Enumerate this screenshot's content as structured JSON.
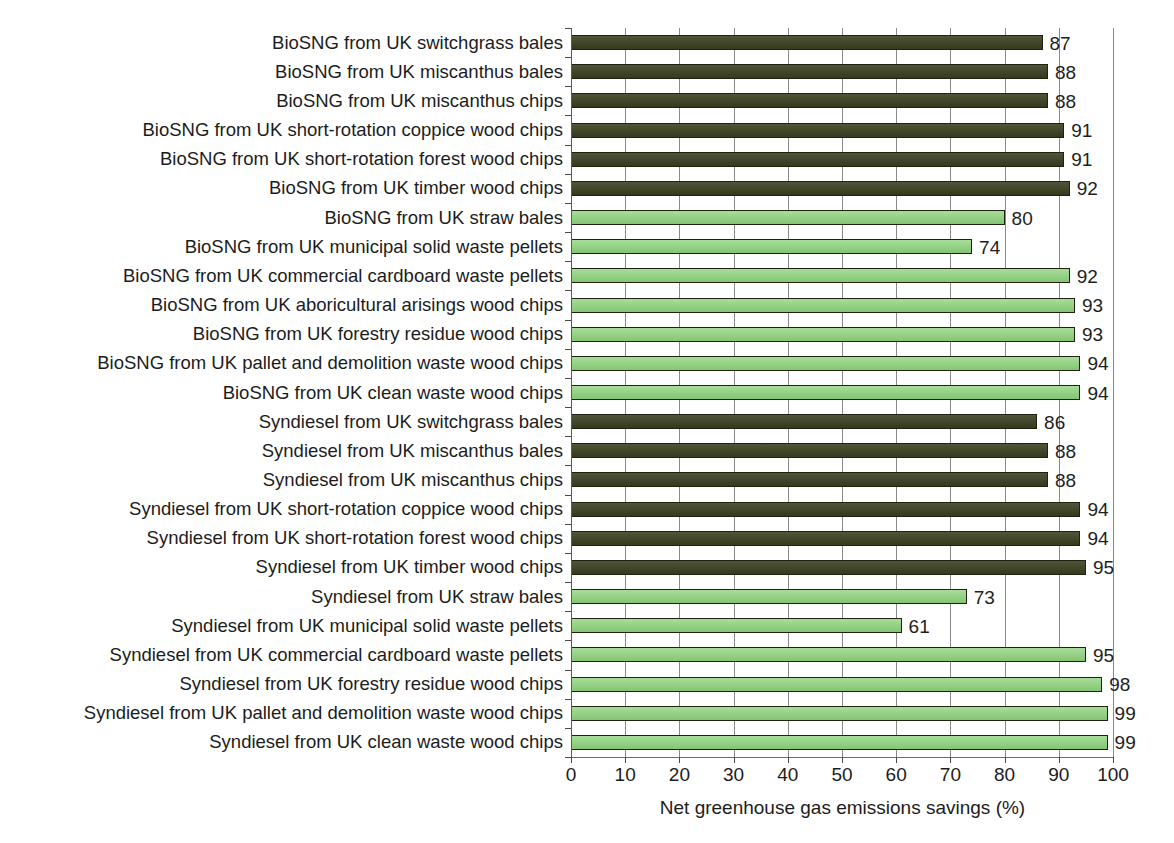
{
  "chart_data": {
    "type": "bar",
    "orientation": "horizontal",
    "title": "",
    "xlabel": "Net greenhouse gas emissions savings (%)",
    "ylabel": "",
    "xlim": [
      0,
      100
    ],
    "xticks": [
      0,
      10,
      20,
      30,
      40,
      50,
      60,
      70,
      80,
      90,
      100
    ],
    "xtick_labels": [
      "0",
      "10",
      "20",
      "30",
      "40",
      "50",
      "60",
      "70",
      "80",
      "90",
      "100"
    ],
    "grid": "vertical",
    "legend": "none",
    "categories": [
      "BioSNG from UK switchgrass bales",
      "BioSNG from UK miscanthus bales",
      "BioSNG from UK miscanthus chips",
      "BioSNG from UK short-rotation coppice wood chips",
      "BioSNG from UK short-rotation forest wood chips",
      "BioSNG from UK timber wood chips",
      "BioSNG from UK straw bales",
      "BioSNG from UK municipal solid waste pellets",
      "BioSNG from UK commercial cardboard waste pellets",
      "BioSNG from UK aboricultural arisings wood chips",
      "BioSNG from UK forestry residue wood chips",
      "BioSNG from UK pallet and demolition waste wood chips",
      "BioSNG from UK clean waste wood chips",
      "Syndiesel from UK switchgrass bales",
      "Syndiesel from UK miscanthus bales",
      "Syndiesel from UK miscanthus chips",
      "Syndiesel from UK short-rotation coppice wood chips",
      "Syndiesel from UK short-rotation forest wood chips",
      "Syndiesel from UK timber wood chips",
      "Syndiesel from UK straw bales",
      "Syndiesel from UK municipal solid waste pellets",
      "Syndiesel from UK commercial cardboard waste pellets",
      "Syndiesel from UK forestry residue wood chips",
      "Syndiesel from UK pallet and demolition waste wood chips",
      "Syndiesel from UK clean waste wood chips"
    ],
    "values": [
      87,
      88,
      88,
      91,
      91,
      92,
      80,
      74,
      92,
      93,
      93,
      94,
      94,
      86,
      88,
      88,
      94,
      94,
      95,
      73,
      61,
      95,
      98,
      99,
      99
    ],
    "value_labels": [
      "87",
      "88",
      "88",
      "91",
      "91",
      "92",
      "80",
      "74",
      "92",
      "93",
      "93",
      "94",
      "94",
      "86",
      "88",
      "88",
      "94",
      "94",
      "95",
      "73",
      "61",
      "95",
      "98",
      "99",
      "99"
    ],
    "group_of_bar": [
      "dark",
      "dark",
      "dark",
      "dark",
      "dark",
      "dark",
      "light",
      "light",
      "light",
      "light",
      "light",
      "light",
      "light",
      "dark",
      "dark",
      "dark",
      "dark",
      "dark",
      "dark",
      "light",
      "light",
      "light",
      "light",
      "light",
      "light"
    ],
    "colors": {
      "dark": "#3c4122",
      "light": "#8ed47c",
      "bar_outline": "#20220f",
      "gridline": "#8a8a8a",
      "axis": "#5a5a5a",
      "text": "#1c1c1c",
      "background": "#ffffff"
    }
  }
}
